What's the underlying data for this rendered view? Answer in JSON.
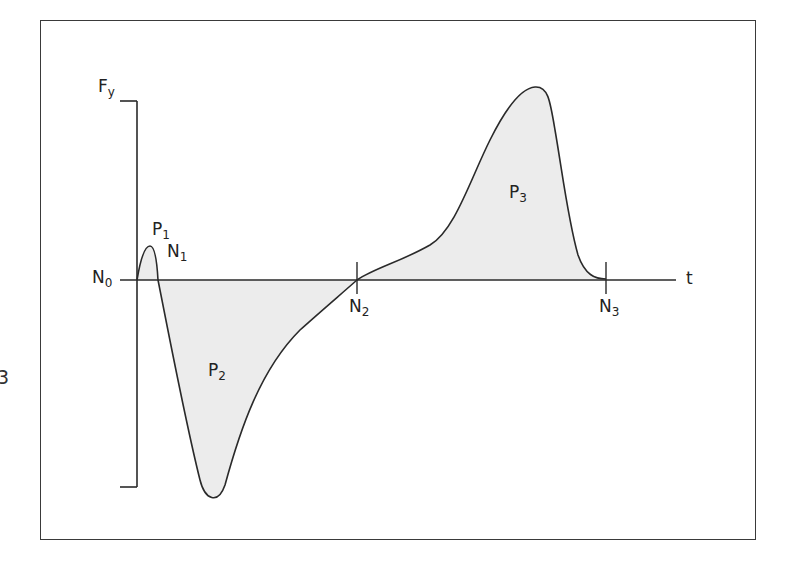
{
  "figure": {
    "type": "force-time curve diagram",
    "y_axis_label": {
      "main": "F",
      "sub": "y"
    },
    "x_axis_label": "t",
    "margin_number": "3",
    "colors": {
      "line": "#2a2a2a",
      "fill": "#ececec",
      "frame": "#3a3a3a",
      "background": "#ffffff"
    },
    "labels": {
      "N0": {
        "main": "N",
        "sub": "0"
      },
      "N1": {
        "main": "N",
        "sub": "1"
      },
      "N2": {
        "main": "N",
        "sub": "2"
      },
      "N3": {
        "main": "N",
        "sub": "3"
      },
      "P1": {
        "main": "P",
        "sub": "1"
      },
      "P2": {
        "main": "P",
        "sub": "2"
      },
      "P3": {
        "main": "P",
        "sub": "3"
      }
    }
  },
  "curve": {
    "description": "Small positive hump P1 after N0, crossing zero at N1, deep negative trough P2, crossing zero at N2, large positive peak P3, returning to zero at N3",
    "regions": [
      {
        "name": "P1",
        "sign": "positive",
        "from": "N0",
        "to": "N1",
        "relative_peak": 0.19
      },
      {
        "name": "P2",
        "sign": "negative",
        "from": "N1",
        "to": "N2",
        "relative_peak": -1.18
      },
      {
        "name": "P3",
        "sign": "positive",
        "from": "N2",
        "to": "N3",
        "relative_peak": 1.0
      }
    ]
  }
}
